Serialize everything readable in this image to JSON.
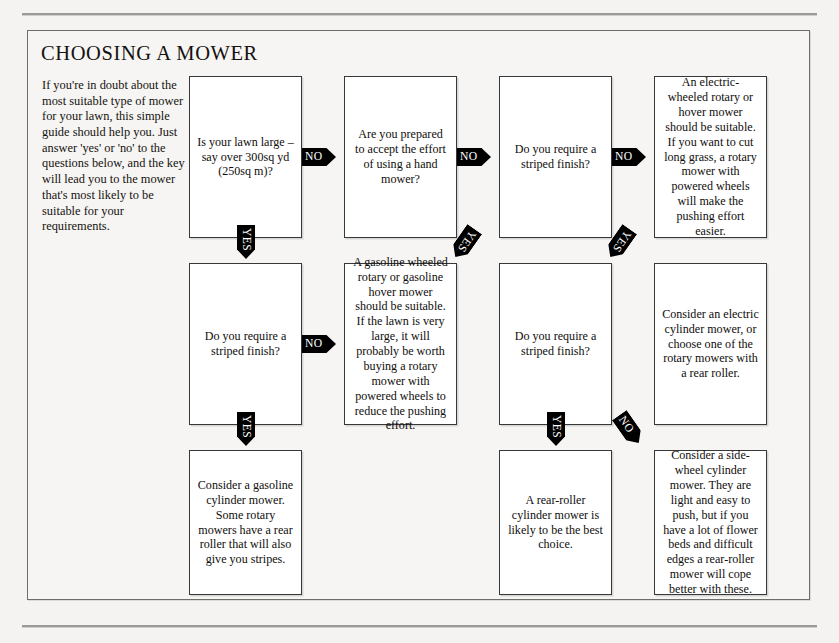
{
  "page": {
    "title": "CHOOSING A MOWER",
    "intro": "If you're in doubt about the most suitable type of mower for your lawn, this simple guide should help you. Just answer 'yes' or 'no' to the questions below, and the key will lead you to the mower that's most likely to be suitable for your requirements.",
    "ink_color": "#100e0c",
    "paper_color": "#f6f5f3",
    "connector_color": "#000000"
  },
  "labels": {
    "yes": "YES",
    "no": "NO"
  },
  "boxes": {
    "r1c1": "Is your lawn large – say over 300sq  yd (250sq  m)?",
    "r1c2": "Are you prepared to accept the effort of using a hand mower?",
    "r1c3": "Do you require a striped finish?",
    "r1c4": "An electric-wheeled rotary or hover mower should be suitable. If you want to cut long grass, a rotary mower with powered wheels will make the pushing effort easier.",
    "r2c1": "Do you require a striped finish?",
    "r2c2": "A gasoline wheeled rotary or gasoline hover mower should be suitable.  If the lawn is very large, it will probably be worth buying a rotary mower with powered wheels to reduce the pushing effort.",
    "r2c3": "Do you require a striped finish?",
    "r2c4": "Consider an electric cylinder mower, or choose one of the rotary mowers with a rear roller.",
    "r3c2": "Consider a gasoline cylinder mower. Some rotary mowers have a rear roller that will also give you stripes.",
    "r3c3": "A rear-roller cylinder mower is likely to be the best choice.",
    "r3c4": "Consider a side-wheel cylinder mower.  They are light and easy to push,  but if you have a lot of flower beds and difficult edges a rear-roller mower will cope better with these."
  },
  "connectors": {
    "c1": "NO",
    "c2": "NO",
    "c3": "NO",
    "c4": "YES",
    "c5": "YES",
    "c6": "YES",
    "c7": "NO",
    "c8": "YES",
    "c9": "YES",
    "c10": "NO"
  }
}
